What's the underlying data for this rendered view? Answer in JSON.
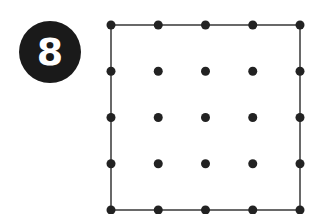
{
  "puzzle": {
    "number_badge": "8",
    "grid": {
      "rows": 5,
      "cols": 5,
      "x0": 111,
      "y0": 25,
      "dx": 47.25,
      "dy": 46.25,
      "dot_radius": 4.5
    },
    "square": {
      "x": 111,
      "y": 25,
      "width": 189,
      "height": 185
    },
    "colors": {
      "dot": "#222222",
      "line": "#444444",
      "badge_bg": "#1a1a1a",
      "badge_text": "#ffffff"
    }
  }
}
